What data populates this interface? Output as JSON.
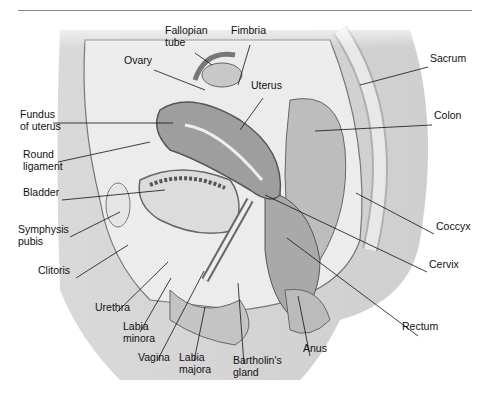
{
  "figure": {
    "type": "anatomical sagittal section",
    "labels": [
      {
        "id": "fallopian-tube",
        "text": "Fallopian\ntube",
        "x": 165,
        "y": 34
      },
      {
        "id": "fimbria",
        "text": "Fimbria",
        "x": 231,
        "y": 34
      },
      {
        "id": "ovary",
        "text": "Ovary",
        "x": 124,
        "y": 64
      },
      {
        "id": "uterus",
        "text": "Uterus",
        "x": 251,
        "y": 89
      },
      {
        "id": "sacrum",
        "text": "Sacrum",
        "x": 430,
        "y": 62
      },
      {
        "id": "fundus-of-uterus",
        "text": "Fundus\nof uterus",
        "x": 20,
        "y": 118
      },
      {
        "id": "colon",
        "text": "Colon",
        "x": 434,
        "y": 119
      },
      {
        "id": "round-ligament",
        "text": "Round\nligament",
        "x": 23,
        "y": 158
      },
      {
        "id": "bladder",
        "text": "Bladder",
        "x": 23,
        "y": 196
      },
      {
        "id": "symphysis-pubis",
        "text": "Symphysis\npubis",
        "x": 18,
        "y": 233
      },
      {
        "id": "clitoris",
        "text": "Clitoris",
        "x": 38,
        "y": 274
      },
      {
        "id": "coccyx",
        "text": "Coccyx",
        "x": 436,
        "y": 230
      },
      {
        "id": "cervix",
        "text": "Cervix",
        "x": 429,
        "y": 268
      },
      {
        "id": "urethra",
        "text": "Urethra",
        "x": 95,
        "y": 311
      },
      {
        "id": "rectum",
        "text": "Rectum",
        "x": 402,
        "y": 330
      },
      {
        "id": "labia-minora",
        "text": "Labia\nminora",
        "x": 123,
        "y": 330
      },
      {
        "id": "anus",
        "text": "Anus",
        "x": 303,
        "y": 352
      },
      {
        "id": "vagina",
        "text": "Vagina",
        "x": 138,
        "y": 361
      },
      {
        "id": "labia-majora",
        "text": "Labia\nmajora",
        "x": 179,
        "y": 361
      },
      {
        "id": "bartholins-gland",
        "text": "Bartholin's\ngland",
        "x": 233,
        "y": 364
      }
    ]
  }
}
